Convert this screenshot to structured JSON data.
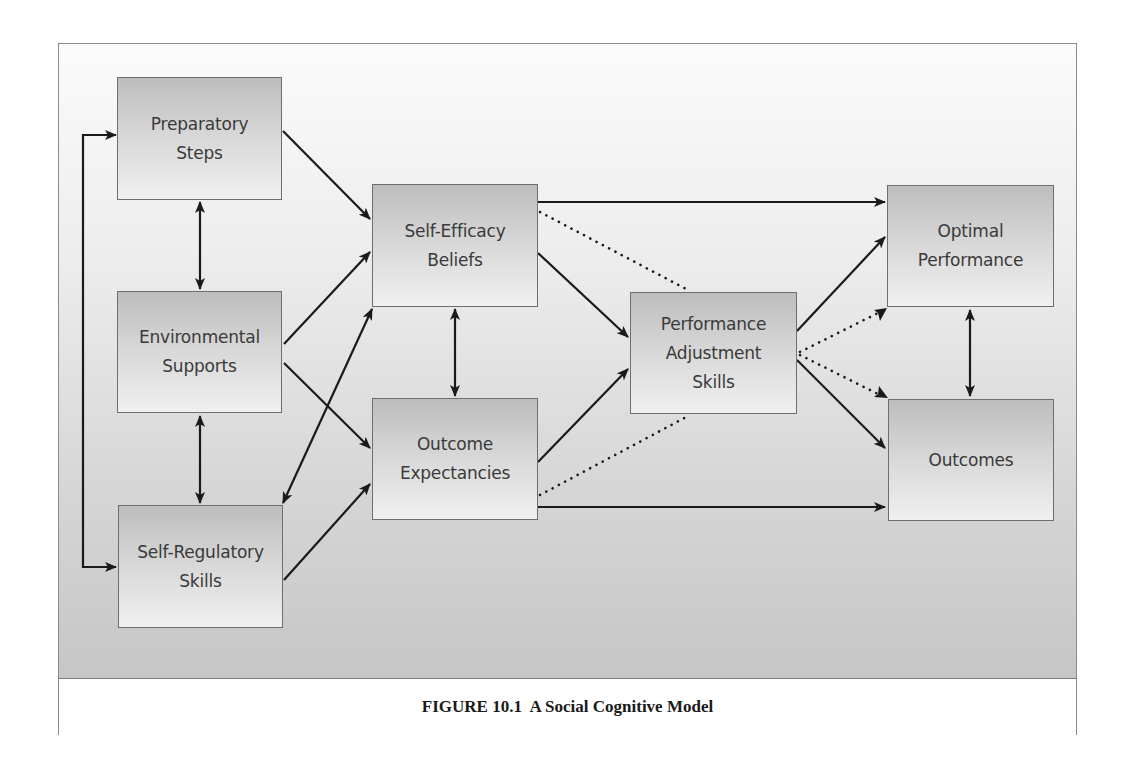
{
  "figure": {
    "caption": "FIGURE 10.1  A Social Cognitive Model",
    "colors": {
      "background_top": "#fbfbfb",
      "background_bottom": "#c6c6c6",
      "node_top": "#bdbdbd",
      "node_bottom": "#f0f0f0",
      "arrow": "#1a1a1a",
      "border": "#6e6e6e"
    }
  },
  "nodes": {
    "preparatory_steps": {
      "label": "Preparatory\nSteps"
    },
    "environmental_supports": {
      "label": "Environmental\nSupports"
    },
    "self_regulatory_skills": {
      "label": "Self-Regulatory\nSkills"
    },
    "self_efficacy_beliefs": {
      "label": "Self-Efficacy\nBeliefs"
    },
    "outcome_expectancies": {
      "label": "Outcome\nExpectancies"
    },
    "performance_adjustment_skills": {
      "label": "Performance\nAdjustment\nSkills"
    },
    "optimal_performance": {
      "label": "Optimal\nPerformance"
    },
    "outcomes": {
      "label": "Outcomes"
    }
  },
  "edges": [
    {
      "from": "Preparatory Steps",
      "to": "Self-Regulatory Skills",
      "style": "solid",
      "direction": "bidirectional-bracket"
    },
    {
      "from": "Preparatory Steps",
      "to": "Environmental Supports",
      "style": "solid",
      "direction": "bidirectional"
    },
    {
      "from": "Environmental Supports",
      "to": "Self-Regulatory Skills",
      "style": "solid",
      "direction": "bidirectional"
    },
    {
      "from": "Preparatory Steps",
      "to": "Self-Efficacy Beliefs",
      "style": "solid",
      "direction": "forward"
    },
    {
      "from": "Environmental Supports",
      "to": "Self-Efficacy Beliefs",
      "style": "solid",
      "direction": "forward"
    },
    {
      "from": "Environmental Supports",
      "to": "Outcome Expectancies",
      "style": "solid",
      "direction": "forward"
    },
    {
      "from": "Self-Regulatory Skills",
      "to": "Self-Efficacy Beliefs",
      "style": "solid",
      "direction": "bidirectional"
    },
    {
      "from": "Self-Regulatory Skills",
      "to": "Outcome Expectancies",
      "style": "solid",
      "direction": "forward"
    },
    {
      "from": "Self-Efficacy Beliefs",
      "to": "Outcome Expectancies",
      "style": "solid",
      "direction": "bidirectional"
    },
    {
      "from": "Self-Efficacy Beliefs",
      "to": "Optimal Performance",
      "style": "solid",
      "direction": "forward"
    },
    {
      "from": "Self-Efficacy Beliefs",
      "to": "Performance Adjustment Skills",
      "style": "solid",
      "direction": "forward"
    },
    {
      "from": "Self-Efficacy Beliefs",
      "to": "Performance Adjustment Skills",
      "style": "dotted",
      "direction": "none"
    },
    {
      "from": "Outcome Expectancies",
      "to": "Performance Adjustment Skills",
      "style": "solid",
      "direction": "forward"
    },
    {
      "from": "Outcome Expectancies",
      "to": "Performance Adjustment Skills",
      "style": "dotted",
      "direction": "none"
    },
    {
      "from": "Outcome Expectancies",
      "to": "Outcomes",
      "style": "solid",
      "direction": "forward"
    },
    {
      "from": "Performance Adjustment Skills",
      "to": "Optimal Performance",
      "style": "solid",
      "direction": "forward"
    },
    {
      "from": "Performance Adjustment Skills",
      "to": "Optimal Performance",
      "style": "dotted",
      "direction": "forward"
    },
    {
      "from": "Performance Adjustment Skills",
      "to": "Outcomes",
      "style": "dotted",
      "direction": "forward"
    },
    {
      "from": "Performance Adjustment Skills",
      "to": "Outcomes",
      "style": "solid",
      "direction": "forward"
    },
    {
      "from": "Optimal Performance",
      "to": "Outcomes",
      "style": "solid",
      "direction": "bidirectional"
    }
  ]
}
